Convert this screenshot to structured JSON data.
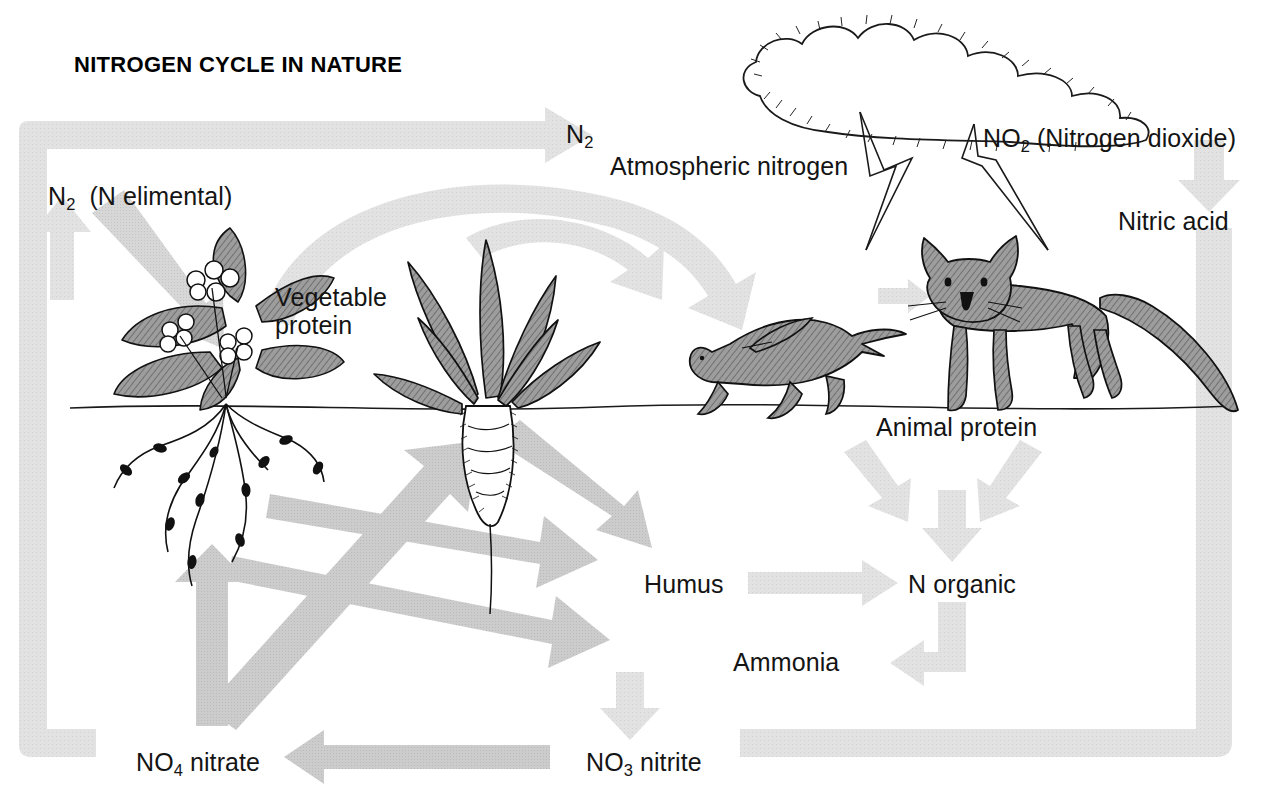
{
  "title": "NITROGEN CYCLE IN NATURE",
  "labels": {
    "n2_atmospheric_symbol": "N",
    "n2_atmospheric_sub": "2",
    "atmospheric_nitrogen": "Atmospheric nitrogen",
    "no2_symbol": "NO",
    "no2_sub": "2",
    "no2_name": "(Nitrogen dioxide)",
    "nitric_acid": "Nitric acid",
    "n2_elemental_symbol": "N",
    "n2_elemental_sub": "2",
    "n2_elemental_name": "(N elimental)",
    "vegetable_protein_line1": "Vegetable",
    "vegetable_protein_line2": "protein",
    "animal_protein": "Animal protein",
    "humus": "Humus",
    "n_organic": "N organic",
    "ammonia": "Ammonia",
    "no4_symbol": "NO",
    "no4_sub": "4",
    "no4_name": "nitrate",
    "no3_symbol": "NO",
    "no3_sub": "3",
    "no3_name": "nitrite"
  },
  "colors": {
    "background": "#ffffff",
    "arrow_light": "#d9d9d9",
    "arrow_mid": "#c8c8c8",
    "arrow_dark": "#bdbdbd",
    "ink": "#141414",
    "organism_fill": "#9a9a9a",
    "organism_fill_light": "#b3b3b3"
  },
  "figures": {
    "cloud": "storm-cloud",
    "lightning_left": "lightning-bolt",
    "lightning_right": "lightning-bolt",
    "plant_flowering": "legume-plant-with-root-nodules",
    "plant_root_vegetable": "beet-plant",
    "animal_prey": "hare",
    "animal_predator": "fox",
    "ground": "ground-line"
  },
  "flows": [
    {
      "name": "n2-to-cloud",
      "from": "N2 Atmospheric nitrogen",
      "to": "cloud"
    },
    {
      "name": "no2-to-nitric-acid",
      "from": "NO2",
      "to": "Nitric acid"
    },
    {
      "name": "nitric-acid-to-soil",
      "from": "Nitric acid",
      "to": "soil"
    },
    {
      "name": "n2-elemental-to-plant",
      "from": "N2 elemental",
      "to": "Vegetable protein"
    },
    {
      "name": "soil-to-n2-elemental",
      "from": "soil",
      "to": "N2 elemental"
    },
    {
      "name": "n2-elemental-to-atmosphere",
      "from": "N2 elemental",
      "to": "Atmospheric nitrogen"
    },
    {
      "name": "vegetable-protein-to-animal-protein",
      "from": "Vegetable protein",
      "to": "Animal protein"
    },
    {
      "name": "animal-protein-to-n-organic",
      "from": "Animal protein",
      "to": "N organic"
    },
    {
      "name": "humus-to-n-organic",
      "from": "Humus",
      "to": "N organic"
    },
    {
      "name": "n-organic-to-ammonia",
      "from": "N organic",
      "to": "Ammonia"
    },
    {
      "name": "ammonia-to-nitrite",
      "from": "Ammonia",
      "to": "NO3 nitrite"
    },
    {
      "name": "nitrite-to-nitrate",
      "from": "NO3 nitrite",
      "to": "NO4 nitrate"
    },
    {
      "name": "nitrate-to-plant",
      "from": "NO4 nitrate",
      "to": "plant roots"
    },
    {
      "name": "plants-to-humus",
      "from": "plants",
      "to": "Humus"
    }
  ]
}
